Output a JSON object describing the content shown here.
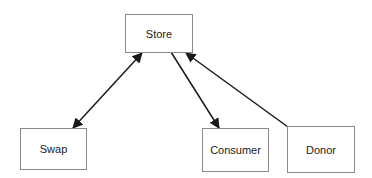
{
  "diagram": {
    "nodes": [
      {
        "id": "store",
        "label": "Store"
      },
      {
        "id": "swap",
        "label": "Swap"
      },
      {
        "id": "consumer",
        "label": "Consumer"
      },
      {
        "id": "donor",
        "label": "Donor"
      }
    ],
    "edges": [
      {
        "from": "store",
        "to": "swap",
        "direction": "bidirectional"
      },
      {
        "from": "store",
        "to": "consumer",
        "direction": "forward"
      },
      {
        "from": "donor",
        "to": "store",
        "direction": "forward"
      }
    ],
    "colors": {
      "line": "#1a1a1a",
      "border": "#8a8a8a",
      "text": "#222222"
    }
  }
}
